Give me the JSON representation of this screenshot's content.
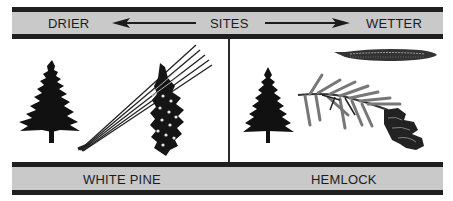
{
  "header": {
    "left_label": "DRIER",
    "center_label": "SITES",
    "right_label": "WETTER",
    "arrows": [
      "arrow-left",
      "arrow-right"
    ]
  },
  "panels": [
    {
      "species": "WHITE PINE",
      "illustrations": [
        "tree-silhouette",
        "needle-cluster",
        "pine-cone"
      ]
    },
    {
      "species": "HEMLOCK",
      "illustrations": [
        "tree-silhouette",
        "single-needle",
        "branch-with-needles",
        "small-cone"
      ]
    }
  ],
  "footer": {
    "left_label": "WHITE PINE",
    "right_label": "HEMLOCK"
  },
  "colors": {
    "bar_fill": "#c9c9c9",
    "bar_border": "#1f1f1f",
    "ink": "#1c1c1c",
    "background": "#ffffff"
  }
}
